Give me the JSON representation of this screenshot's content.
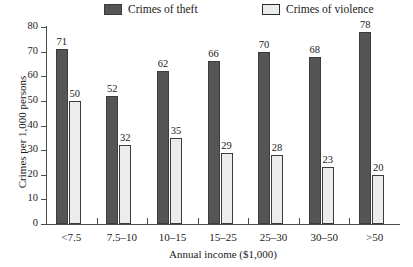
{
  "chart_data": {
    "type": "bar",
    "title": "",
    "subtitle": "",
    "xlabel": "Annual income ($1,000)",
    "ylabel": "Crimes per 1,000 persons",
    "categories": [
      "<7.5",
      "7.5–10",
      "10–15",
      "15–25",
      "25–30",
      "30–50",
      ">50"
    ],
    "series": [
      {
        "name": "Crimes of theft",
        "color": "#555555",
        "values": [
          71,
          52,
          62,
          66,
          70,
          68,
          78
        ]
      },
      {
        "name": "Crimes of violence",
        "color": "#ececec",
        "values": [
          50,
          32,
          35,
          29,
          28,
          23,
          20
        ]
      }
    ],
    "ylim": [
      0,
      80
    ],
    "yticks": [
      0,
      10,
      20,
      30,
      40,
      50,
      60,
      70,
      80
    ],
    "ytick_labels": [
      "0",
      "10",
      "20",
      "30",
      "40",
      "50",
      "60",
      "70",
      "80"
    ],
    "grid": false,
    "legend_position": "top",
    "data_labels": true
  },
  "legend": {
    "entries": [
      {
        "label": "Crimes of theft",
        "swatch": "dark-gray-swatch"
      },
      {
        "label": "Crimes of violence",
        "swatch": "light-gray-swatch"
      }
    ]
  },
  "axes": {
    "y_title": "Crimes per 1,000 persons",
    "x_title": "Annual income ($1,000)"
  },
  "colors": {
    "theft_fill": "#555555",
    "violence_fill": "#ececec",
    "outline": "#3c3c3c",
    "axis": "#4a4a4a",
    "text": "#1a1a1a",
    "background": "#ffffff"
  }
}
